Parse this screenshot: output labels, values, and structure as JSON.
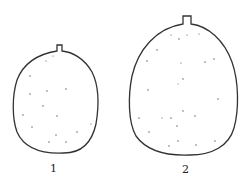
{
  "figure": {
    "type": "botanical line drawing",
    "items": [
      {
        "label": "1",
        "description": "smaller fruit, round with short stem"
      },
      {
        "label": "2",
        "description": "larger fruit, oval with short stem"
      }
    ],
    "line_color": "#333333",
    "background": "#ffffff"
  }
}
